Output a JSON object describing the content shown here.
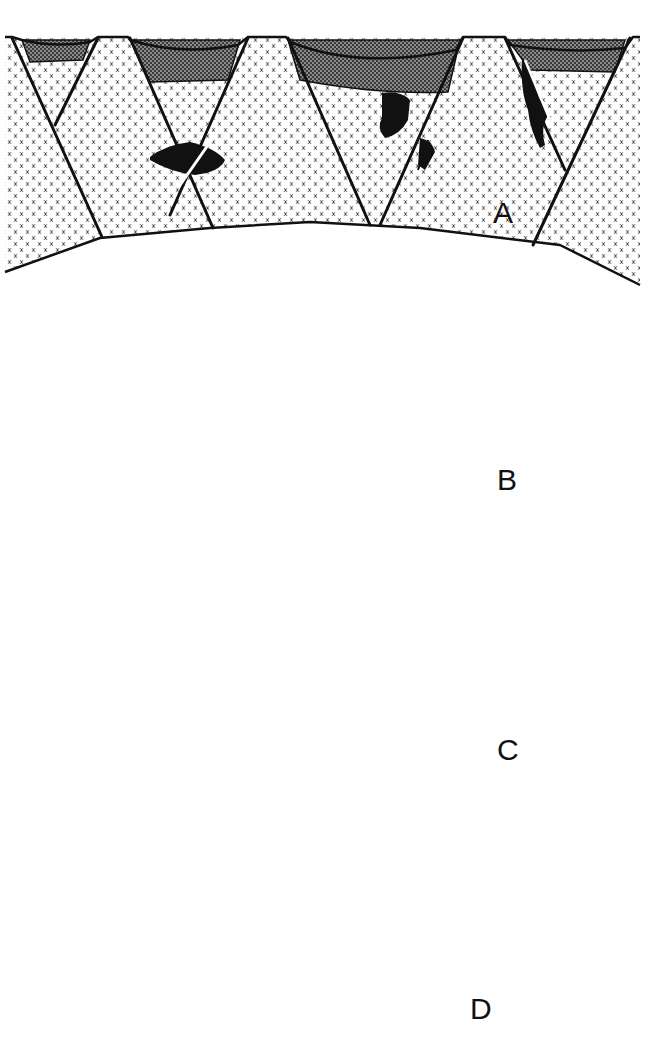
{
  "figure": {
    "panels": [
      {
        "id": "A",
        "label": "A",
        "style": "planar tilted fault blocks with basin sediments and vein ore bodies"
      },
      {
        "id": "B",
        "label": "B",
        "style": "listric faults soling into a detachment above a stratified layer with ore lenses"
      },
      {
        "id": "C",
        "label": "C",
        "style": "anastomosing fault network through stratified layer with ore lenses"
      },
      {
        "id": "D",
        "label": "D",
        "style": "imbricate fault blocks above a low-angle detachment with shear-sense arrows"
      }
    ],
    "legend_patterns": {
      "basement": "dashed hatch (crystalline)",
      "basin_fill": "dark stipple (grey)",
      "stratified_layer": "dotted horizontal lines",
      "ore": "solid black"
    },
    "colors": {
      "ink": "#111111",
      "background": "#ffffff",
      "basin_fill": "#6e6e6e"
    }
  }
}
